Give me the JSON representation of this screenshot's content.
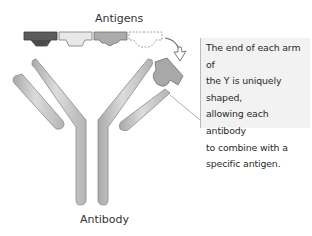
{
  "labels": {
    "antigens": "Antigens",
    "antibody": "Antibody"
  },
  "callout": {
    "text": "The end of each arm of the Y is uniquely shaped, allowing each antibody to combine with a specific antigen.",
    "lines": [
      "The end of each arm of",
      "the Y is uniquely shaped,",
      "allowing each antibody",
      "to combine with a",
      "specific antigen."
    ]
  },
  "antigens": [
    {
      "name": "antigen-dark",
      "fill": "#5a5a5a"
    },
    {
      "name": "antigen-light",
      "fill": "#e6e6e6"
    },
    {
      "name": "antigen-medium",
      "fill": "#a8a8a8"
    },
    {
      "name": "antigen-dashed-outline",
      "fill": "none"
    }
  ],
  "colors": {
    "arm_fill": "#c8c8c8",
    "arm_stroke": "#8c8c8c",
    "bound_antigen": "#a8a8a8",
    "callout_bg": "#f2f2f2"
  }
}
